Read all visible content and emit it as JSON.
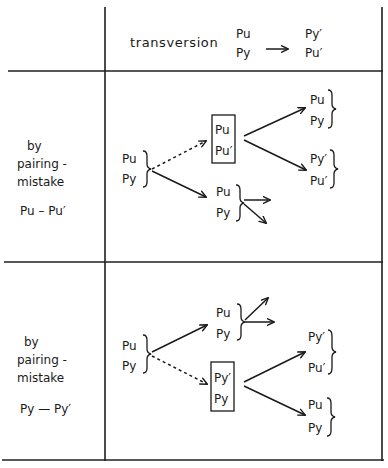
{
  "header": {
    "title": "transversion",
    "from_top": "Pu",
    "from_bottom": "Py",
    "to_top": "Py′",
    "to_bottom": "Pu′"
  },
  "rows": [
    {
      "label_line1": "by",
      "label_line2": "pairing -",
      "label_line3": "mistake",
      "pair": "Pu – Pu′",
      "source": {
        "top": "Pu",
        "bottom": "Py"
      },
      "mispaired_box": {
        "top": "Pu",
        "bottom": "Pu′"
      },
      "normal_pair": {
        "top": "Pu",
        "bottom": "Py"
      },
      "result_1": {
        "top": "Pu",
        "bottom": "Py"
      },
      "result_2": {
        "top": "Py′",
        "bottom": "Pu′"
      }
    },
    {
      "label_line1": "by",
      "label_line2": "pairing -",
      "label_line3": "mistake",
      "pair": "Py — Py′",
      "source": {
        "top": "Pu",
        "bottom": "Py"
      },
      "normal_pair": {
        "top": "Pu",
        "bottom": "Py"
      },
      "mispaired_box": {
        "top": "Py′",
        "bottom": "Py"
      },
      "result_1": {
        "top": "Py′",
        "bottom": "Pu′"
      },
      "result_2": {
        "top": "Pu",
        "bottom": "Py"
      }
    }
  ],
  "colors": {
    "ink": "#1a1a1a",
    "paper": "#ffffff"
  }
}
